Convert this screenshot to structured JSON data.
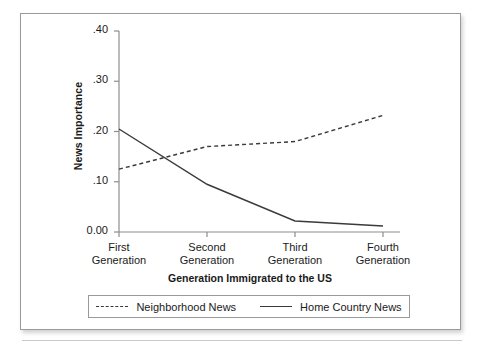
{
  "figure": {
    "y_axis_title": "News Importance",
    "x_axis_title": "Generation Immigrated to the US"
  },
  "axes": {
    "y_ticks": [
      {
        "label": ".40",
        "value": 0.4
      },
      {
        "label": ".30",
        "value": 0.3
      },
      {
        "label": ".20",
        "value": 0.2
      },
      {
        "label": ".10",
        "value": 0.1
      },
      {
        "label": "0.00",
        "value": 0.0
      }
    ],
    "x_ticks": [
      {
        "line1": "First",
        "line2": "Generation"
      },
      {
        "line1": "Second",
        "line2": "Generation"
      },
      {
        "line1": "Third",
        "line2": "Generation"
      },
      {
        "line1": "Fourth",
        "line2": "Generation"
      }
    ]
  },
  "legend": {
    "entries": [
      {
        "label": "Neighborhood News",
        "style": "dashed",
        "color": "#3a3a3a"
      },
      {
        "label": "Home Country News",
        "style": "solid",
        "color": "#3a3a3a"
      }
    ]
  },
  "chart_data": {
    "type": "line",
    "title": "",
    "xlabel": "Generation Immigrated to the US",
    "ylabel": "News Importance",
    "categories": [
      "First Generation",
      "Second Generation",
      "Third Generation",
      "Fourth Generation"
    ],
    "ylim": [
      0.0,
      0.4
    ],
    "yticks": [
      0.0,
      0.1,
      0.2,
      0.3,
      0.4
    ],
    "grid": false,
    "legend_position": "bottom",
    "series": [
      {
        "name": "Neighborhood News",
        "style": "dashed",
        "color": "#3a3a3a",
        "values": [
          0.125,
          0.17,
          0.18,
          0.232
        ]
      },
      {
        "name": "Home Country News",
        "style": "solid",
        "color": "#3a3a3a",
        "values": [
          0.205,
          0.095,
          0.022,
          0.012
        ]
      }
    ]
  }
}
